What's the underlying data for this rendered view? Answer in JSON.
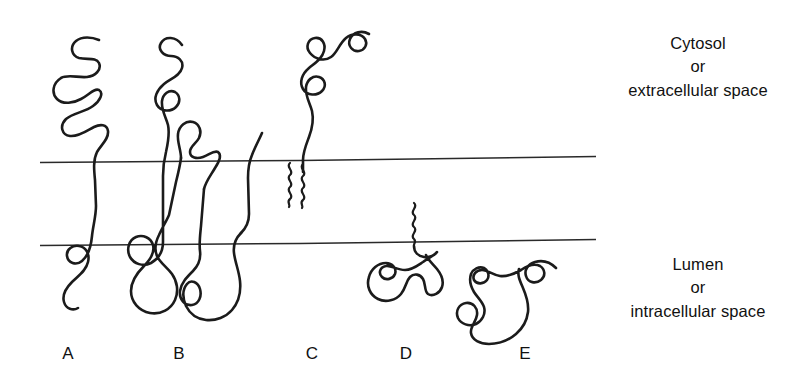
{
  "figure": {
    "background_color": "#ffffff",
    "stroke_color": "#1b1b1b",
    "membrane_line_color": "#2a2a2a"
  },
  "regions": {
    "top": {
      "line1": "Cytosol",
      "line2": "or",
      "line3": "extracellular space"
    },
    "bottom": {
      "line1": "Lumen",
      "line2": "or",
      "line3": "intracellular space"
    }
  },
  "membrane": {
    "upper_leaflet_y": 160,
    "lower_leaflet_y": 243,
    "x_start": 40,
    "x_end": 596
  },
  "panels": [
    {
      "letter": "A",
      "name": "single-pass-transmembrane-protein",
      "description": "Single-pass transmembrane protein with coiled domain in cytosol and short coiled tail in lumen",
      "membrane_passes": 1,
      "lipid_anchors": 0
    },
    {
      "letter": "B",
      "name": "multi-pass-transmembrane-protein",
      "description": "Multi-pass transmembrane protein crossing the bilayer four times with loops on both sides",
      "membrane_passes": 4,
      "lipid_anchors": 0
    },
    {
      "letter": "C",
      "name": "lipid-anchored-cytosolic-protein",
      "description": "Protein on the cytosolic face anchored to the upper leaflet by two acyl chains",
      "membrane_passes": 0,
      "lipid_anchors": 2
    },
    {
      "letter": "D",
      "name": "lipid-anchored-luminal-protein",
      "description": "Protein on the luminal face anchored to the lower leaflet by a single acyl chain",
      "membrane_passes": 0,
      "lipid_anchors": 1
    },
    {
      "letter": "E",
      "name": "peripheral-soluble-protein",
      "description": "Soluble globular protein free in the lumen, not attached to the membrane",
      "membrane_passes": 0,
      "lipid_anchors": 0
    }
  ]
}
